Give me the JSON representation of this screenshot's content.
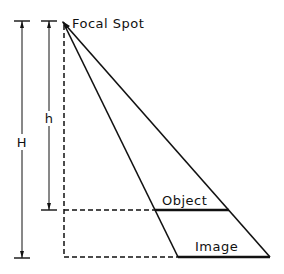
{
  "diagram": {
    "labels": {
      "focal_spot": "Focal Spot",
      "object": "Object",
      "image": "Image",
      "H": "H",
      "h": "h"
    }
  }
}
